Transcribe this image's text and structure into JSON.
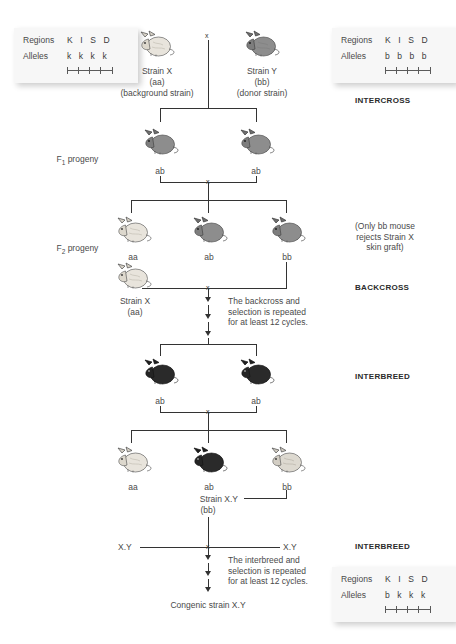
{
  "diagram": {
    "stage_labels": {
      "intercross": "INTERCROSS",
      "backcross": "BACKCROSS",
      "interbreed": "INTERBREED",
      "interbreed2": "INTERBREED"
    },
    "generation_labels": {
      "f1": "F",
      "f1_sub": "1",
      "f1_rest": " progeny",
      "f2": "F",
      "f2_sub": "2",
      "f2_rest": " progeny"
    },
    "parents": {
      "strain_x": {
        "name": "Strain X",
        "genotype": "(aa)",
        "role": "(background strain)"
      },
      "strain_y": {
        "name": "Strain Y",
        "genotype": "(bb)",
        "role": "(donor strain)"
      },
      "cross_symbol": "x"
    },
    "allele_boxes": {
      "strain_x": {
        "regions_label": "Regions",
        "regions_value": "K I S D",
        "alleles_label": "Alleles",
        "alleles_value": "k k k k"
      },
      "strain_y": {
        "regions_label": "Regions",
        "regions_value": "K I S D",
        "alleles_label": "Alleles",
        "alleles_value": "b b b b"
      },
      "congenic": {
        "regions_label": "Regions",
        "regions_value": "K I S D",
        "alleles_label": "Alleles",
        "alleles_value": "b k k k"
      }
    },
    "f1_progeny": [
      {
        "genotype": "ab",
        "coat": "gray"
      },
      {
        "genotype": "ab",
        "coat": "gray"
      }
    ],
    "f2_progeny": [
      {
        "genotype": "aa",
        "coat": "light"
      },
      {
        "genotype": "ab",
        "coat": "gray"
      },
      {
        "genotype": "bb",
        "coat": "gray"
      }
    ],
    "f2_note": "(Only bb mouse\nrejects Strain X\nskin graft)",
    "backcross_parent": {
      "name": "Strain X",
      "genotype": "(aa)"
    },
    "backcross_note": "The backcross and\nselection is repeated\nfor at least 12 cycles.",
    "interbreed_progeny": [
      {
        "genotype": "ab",
        "coat": "black"
      },
      {
        "genotype": "ab",
        "coat": "black"
      }
    ],
    "final_progeny": [
      {
        "genotype": "aa",
        "coat": "light"
      },
      {
        "genotype": "ab",
        "coat": "black"
      },
      {
        "genotype": "bb",
        "coat": "light"
      }
    ],
    "selected_strain": {
      "name": "Strain X.Y",
      "genotype": "(bb)"
    },
    "final_cross": {
      "left": "X.Y",
      "right": "X.Y"
    },
    "interbreed_note": "The interbreed and\nselection is repeated\nfor at least 12 cycles.",
    "result_label": "Congenic strain X.Y"
  },
  "colors": {
    "line": "#333333",
    "text": "#4a4a4a",
    "box_bg": "#f7f7f7",
    "mouse_light": "#e8e4dc",
    "mouse_gray": "#8d8d8d",
    "mouse_black": "#2a2a2a"
  }
}
